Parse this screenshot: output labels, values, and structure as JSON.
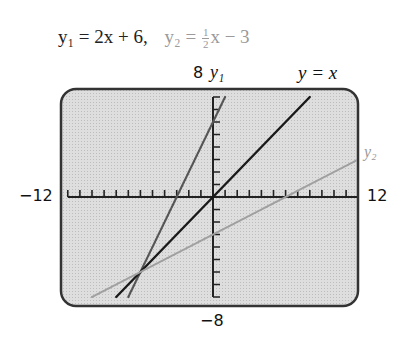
{
  "title": {
    "eq1": "y₁ = 2x + 6,",
    "eq2_prefix": "y₂ = ",
    "eq2_num": "1",
    "eq2_den": "2",
    "eq2_suffix": "x − 3"
  },
  "labels": {
    "ymax": "8",
    "ymin": "−8",
    "xmin": "−12",
    "xmax": "12",
    "y1": "y₁",
    "y2": "y₂",
    "yx": "y = x"
  },
  "colors": {
    "screen_bg": "#d9d9d9",
    "frame": "#333333",
    "y1": "#555555",
    "yx": "#1a1a1a",
    "y2": "#a0a0a0"
  },
  "chart_data": {
    "type": "line",
    "xlabel": "",
    "ylabel": "",
    "xlim": [
      -12,
      12
    ],
    "ylim": [
      -8,
      8
    ],
    "xscale_ticks": 1,
    "yscale_ticks": 1,
    "grid": false,
    "series": [
      {
        "name": "y1",
        "equation": "y = 2x + 6",
        "x": [
          -7,
          1
        ],
        "y": [
          -8,
          8
        ]
      },
      {
        "name": "y = x",
        "equation": "y = x",
        "x": [
          -8,
          8
        ],
        "y": [
          -8,
          8
        ]
      },
      {
        "name": "y2",
        "equation": "y = 0.5x - 3",
        "x": [
          -10,
          12
        ],
        "y": [
          -8,
          3
        ]
      }
    ],
    "annotations": [
      "All three lines intersect at (-6, -6)"
    ]
  }
}
